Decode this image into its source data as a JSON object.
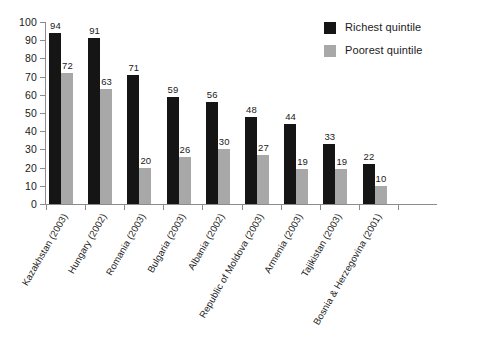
{
  "chart_data": {
    "type": "bar",
    "title": "",
    "xlabel": "",
    "ylabel": "",
    "ylim": [
      0,
      100
    ],
    "yticks": [
      0,
      10,
      20,
      30,
      40,
      50,
      60,
      70,
      80,
      90,
      100
    ],
    "grid": false,
    "legend_position": "top-right",
    "categories": [
      "Kazakhstan (2003)",
      "Hungary (2002)",
      "Romania (2003)",
      "Bulgaria (2003)",
      "Albania (2002)",
      "Republic of Moldova (2003)",
      "Armenia (2003)",
      "Tajikistan (2003)",
      "Bosnia & Herzegovina (2001)"
    ],
    "series": [
      {
        "name": "Richest quintile",
        "color": "#151515",
        "values": [
          94,
          91,
          71,
          59,
          56,
          48,
          44,
          33,
          22
        ]
      },
      {
        "name": "Poorest quintile",
        "color": "#a8a8a8",
        "values": [
          72,
          63,
          20,
          26,
          30,
          27,
          19,
          19,
          10
        ]
      }
    ]
  },
  "legend": {
    "items": [
      {
        "label": "Richest quintile",
        "swatch": "rich"
      },
      {
        "label": "Poorest quintile",
        "swatch": "poor"
      }
    ]
  }
}
